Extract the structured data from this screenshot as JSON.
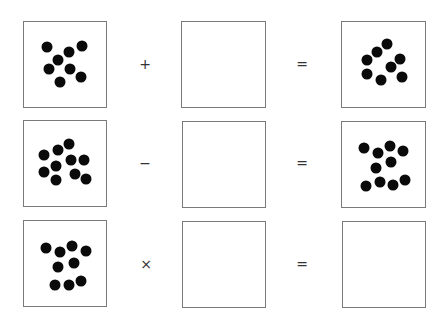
{
  "puzzle": {
    "rows": [
      {
        "operator": "+",
        "equals": "=",
        "left_dots": [
          [
            47,
            47
          ],
          [
            82,
            46
          ],
          [
            69,
            52
          ],
          [
            58,
            60
          ],
          [
            49,
            69
          ],
          [
            70,
            69
          ],
          [
            81,
            77
          ],
          [
            60,
            82
          ]
        ],
        "middle_dots": [],
        "result_dots": [
          [
            387,
            44
          ],
          [
            377,
            52
          ],
          [
            367,
            60
          ],
          [
            400,
            59
          ],
          [
            391,
            67
          ],
          [
            367,
            74
          ],
          [
            381,
            80
          ],
          [
            402,
            77
          ]
        ]
      },
      {
        "operator": "−",
        "equals": "=",
        "left_dots": [
          [
            69,
            144
          ],
          [
            58,
            150
          ],
          [
            44,
            155
          ],
          [
            71,
            160
          ],
          [
            84,
            160
          ],
          [
            56,
            166
          ],
          [
            44,
            172
          ],
          [
            75,
            174
          ],
          [
            56,
            180
          ],
          [
            86,
            179
          ]
        ],
        "middle_dots": [],
        "result_dots": [
          [
            364,
            148
          ],
          [
            378,
            153
          ],
          [
            390,
            146
          ],
          [
            403,
            151
          ],
          [
            391,
            162
          ],
          [
            376,
            168
          ],
          [
            366,
            186
          ],
          [
            380,
            182
          ],
          [
            393,
            185
          ],
          [
            405,
            180
          ]
        ]
      },
      {
        "operator": "×",
        "equals": "=",
        "left_dots": [
          [
            46,
            248
          ],
          [
            60,
            252
          ],
          [
            72,
            246
          ],
          [
            86,
            251
          ],
          [
            58,
            267
          ],
          [
            74,
            263
          ],
          [
            55,
            285
          ],
          [
            69,
            285
          ],
          [
            81,
            281
          ]
        ],
        "middle_dots": [],
        "result_dots": []
      }
    ]
  },
  "colors": {
    "border": "#7a7a7a",
    "dot": "#0a0a0a",
    "background": "#ffffff"
  }
}
